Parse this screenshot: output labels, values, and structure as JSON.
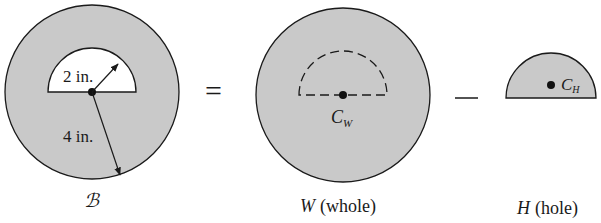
{
  "figure": {
    "composite_label": "ℬ",
    "equals": "=",
    "minus": "−",
    "colors": {
      "fill": "#c9c9c9",
      "stroke": "#1a1a1a",
      "background": "#ffffff"
    },
    "composite": {
      "inner_dim_label": "2 in.",
      "outer_dim_label": "4 in."
    },
    "whole": {
      "centroid_main": "C",
      "centroid_sub": "W",
      "caption_var": "W",
      "caption_text": "(whole)"
    },
    "hole": {
      "centroid_main": "C",
      "centroid_sub": "H",
      "caption_var": "H",
      "caption_text": "(hole)"
    }
  }
}
